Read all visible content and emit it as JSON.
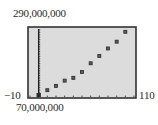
{
  "chart_data": {
    "type": "scatter",
    "title": "",
    "xlabel": "",
    "ylabel": "",
    "xlim": [
      -10,
      110
    ],
    "ylim": [
      70000000,
      290000000
    ],
    "grid": false,
    "legend": null,
    "window_labels": {
      "xmin": "−10",
      "xmax": "110",
      "ymin": "70,000,000",
      "ymax": "290,000,000"
    },
    "x_tick_step": 10,
    "x": [
      0,
      10,
      20,
      30,
      40,
      50,
      60,
      70,
      80,
      90,
      100
    ],
    "y": [
      76000000,
      92000000,
      106000000,
      123000000,
      132000000,
      151000000,
      179000000,
      203000000,
      227000000,
      249000000,
      281000000
    ],
    "marker": "square",
    "colors": {
      "screen_bg": "#dcdcdc",
      "frame": "#333333",
      "marker": "#2b2b2b",
      "axis": "#222222"
    }
  }
}
